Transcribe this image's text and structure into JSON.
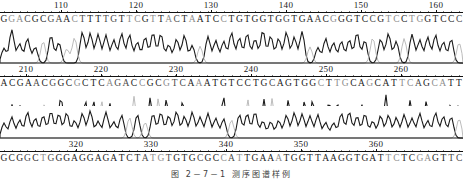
{
  "figure": {
    "type": "sanger-sequencing-chromatogram",
    "caption": "图 2－7－1  测序图谱样例",
    "panel_count": 3,
    "colors": {
      "trace_dark": "#1a1a1a",
      "trace_light": "#b4b4b4",
      "axis": "#111111",
      "background": "#ffffff"
    }
  },
  "panels": [
    {
      "id": "panel-1",
      "ruler": {
        "ticks": [
          110,
          120,
          130,
          140,
          150,
          160
        ],
        "tick_x": [
          61,
          136,
          211,
          286,
          361,
          436
        ]
      },
      "sequence": "GGACGCGAACTTTTGTTCGTTACTAATCCTGTGGTGGTGAACGGGTCCGTCCTGGTCCC",
      "start_position": 106,
      "trace_style": "broad-peaks"
    },
    {
      "id": "panel-2",
      "ruler": {
        "ticks": [
          210,
          220,
          230,
          240,
          250,
          260
        ],
        "tick_x": [
          26,
          101,
          176,
          251,
          326,
          401
        ]
      },
      "sequence": "ACGAACGGCGCTCAGACCGCGTCAAATGTCCTGCAGTGGCTTGCAGCATTCAGCATT",
      "start_position": 207,
      "trace_style": "sharp-peaks"
    },
    {
      "id": "panel-3",
      "ruler": {
        "ticks": [
          320,
          330,
          340,
          350,
          360
        ],
        "tick_x": [
          76,
          151,
          226,
          301,
          376
        ]
      },
      "sequence": "GCGGCTGGGAGGAGATCTATGTGTGCGCCATTGAAATGGTTAAGGTGATTCTCGAGTTC",
      "start_position": 311,
      "trace_style": "broad-peaks"
    }
  ],
  "chart_data": {
    "type": "line",
    "xlabel": "base position",
    "ylabel": "fluorescence intensity",
    "grid": false,
    "legend": "none",
    "series": [
      {
        "name": "panel-1-trace",
        "x_range": [
          106,
          164
        ],
        "bases": [
          "G",
          "G",
          "A",
          "C",
          "G",
          "C",
          "G",
          "A",
          "A",
          "C",
          "T",
          "T",
          "T",
          "T",
          "G",
          "T",
          "T",
          "C",
          "G",
          "T",
          "T",
          "A",
          "C",
          "T",
          "A",
          "A",
          "T",
          "C",
          "C",
          "T",
          "G",
          "T",
          "G",
          "G",
          "T",
          "G",
          "G",
          "T",
          "G",
          "A",
          "A",
          "C",
          "G",
          "G",
          "G",
          "T",
          "C",
          "C",
          "G",
          "T",
          "C",
          "C",
          "T",
          "G",
          "G",
          "T",
          "C",
          "C",
          "C"
        ],
        "values": [
          42,
          95,
          55,
          70,
          45,
          62,
          78,
          58,
          40,
          72,
          88,
          85,
          82,
          80,
          66,
          84,
          81,
          60,
          74,
          86,
          83,
          52,
          68,
          79,
          50,
          48,
          76,
          64,
          62,
          87,
          72,
          84,
          68,
          92,
          77,
          70,
          88,
          74,
          90,
          46,
          44,
          70,
          58,
          62,
          66,
          86,
          64,
          72,
          68,
          84,
          62,
          70,
          82,
          66,
          74,
          80,
          60,
          68,
          58
        ]
      },
      {
        "name": "panel-2-trace",
        "x_range": [
          207,
          264
        ],
        "bases": [
          "A",
          "C",
          "G",
          "A",
          "A",
          "C",
          "G",
          "G",
          "C",
          "G",
          "C",
          "T",
          "C",
          "A",
          "G",
          "A",
          "C",
          "C",
          "G",
          "C",
          "G",
          "T",
          "C",
          "A",
          "A",
          "A",
          "T",
          "G",
          "T",
          "C",
          "C",
          "T",
          "G",
          "C",
          "A",
          "G",
          "T",
          "G",
          "G",
          "C",
          "T",
          "T",
          "G",
          "C",
          "A",
          "G",
          "C",
          "A",
          "T",
          "T",
          "C",
          "A",
          "G",
          "C",
          "A",
          "T",
          "T"
        ],
        "values": [
          30,
          55,
          52,
          28,
          34,
          60,
          50,
          88,
          22,
          30,
          72,
          70,
          68,
          60,
          24,
          26,
          84,
          26,
          80,
          78,
          76,
          30,
          70,
          24,
          26,
          58,
          22,
          88,
          28,
          30,
          72,
          26,
          74,
          76,
          24,
          72,
          26,
          70,
          74,
          22,
          68,
          66,
          24,
          20,
          58,
          24,
          26,
          90,
          22,
          24,
          70,
          26,
          68,
          22,
          20,
          60,
          62
        ]
      },
      {
        "name": "panel-3-trace",
        "x_range": [
          311,
          369
        ],
        "bases": [
          "G",
          "C",
          "G",
          "G",
          "C",
          "T",
          "G",
          "G",
          "G",
          "A",
          "G",
          "G",
          "A",
          "G",
          "A",
          "T",
          "C",
          "T",
          "A",
          "T",
          "G",
          "T",
          "G",
          "T",
          "G",
          "C",
          "G",
          "C",
          "C",
          "A",
          "T",
          "T",
          "G",
          "A",
          "A",
          "A",
          "T",
          "G",
          "G",
          "T",
          "T",
          "A",
          "A",
          "G",
          "G",
          "T",
          "G",
          "A",
          "T",
          "T",
          "C",
          "T",
          "C",
          "G",
          "A",
          "G",
          "T",
          "T",
          "C"
        ],
        "values": [
          50,
          70,
          60,
          86,
          66,
          74,
          88,
          80,
          84,
          58,
          82,
          90,
          56,
          86,
          54,
          76,
          68,
          78,
          52,
          80,
          84,
          74,
          88,
          72,
          86,
          70,
          82,
          66,
          64,
          60,
          78,
          80,
          86,
          56,
          54,
          58,
          76,
          84,
          80,
          74,
          78,
          52,
          50,
          82,
          86,
          72,
          80,
          56,
          74,
          76,
          68,
          78,
          66,
          82,
          58,
          84,
          72,
          70,
          64
        ]
      }
    ]
  }
}
